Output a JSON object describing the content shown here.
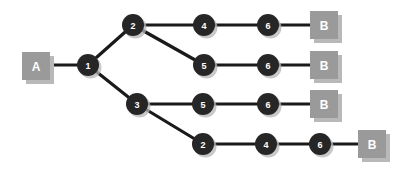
{
  "diagram": {
    "background_color": "#ffffff",
    "node_color": "#262626",
    "node_text_color": "#ffffff",
    "terminal_box_color": "#9a9a9a",
    "terminal_box_shadow_color": "#b9b9b9",
    "terminal_box_text_color": "#ffffff",
    "edge_color": "#1a1a1a",
    "source_label": "A",
    "destination_label": "B",
    "boxes": [
      {
        "id": "box-source-a",
        "label": "A",
        "x": 22,
        "y": 52,
        "w": 28,
        "h": 28
      },
      {
        "id": "box-dest-b-1",
        "label": "B",
        "x": 310,
        "y": 11,
        "w": 28,
        "h": 28
      },
      {
        "id": "box-dest-b-2",
        "label": "B",
        "x": 310,
        "y": 51,
        "w": 28,
        "h": 28
      },
      {
        "id": "box-dest-b-3",
        "label": "B",
        "x": 310,
        "y": 90,
        "w": 28,
        "h": 28
      },
      {
        "id": "box-dest-b-4",
        "label": "B",
        "x": 358,
        "y": 130,
        "w": 28,
        "h": 28
      }
    ],
    "nodes": [
      {
        "id": "node-1",
        "label": "1",
        "cx": 88,
        "cy": 65,
        "r": 11
      },
      {
        "id": "node-2-a",
        "label": "2",
        "cx": 133,
        "cy": 25,
        "r": 11
      },
      {
        "id": "node-3",
        "label": "3",
        "cx": 137,
        "cy": 104,
        "r": 11
      },
      {
        "id": "node-4-a",
        "label": "4",
        "cx": 204,
        "cy": 25,
        "r": 11
      },
      {
        "id": "node-6-a",
        "label": "6",
        "cx": 268,
        "cy": 25,
        "r": 11
      },
      {
        "id": "node-5-b",
        "label": "5",
        "cx": 204,
        "cy": 65,
        "r": 11
      },
      {
        "id": "node-6-b",
        "label": "6",
        "cx": 268,
        "cy": 65,
        "r": 11
      },
      {
        "id": "node-5-c",
        "label": "5",
        "cx": 203,
        "cy": 104,
        "r": 11
      },
      {
        "id": "node-6-c",
        "label": "6",
        "cx": 268,
        "cy": 104,
        "r": 11
      },
      {
        "id": "node-2-d",
        "label": "2",
        "cx": 203,
        "cy": 144,
        "r": 11
      },
      {
        "id": "node-4-d",
        "label": "4",
        "cx": 266,
        "cy": 144,
        "r": 11
      },
      {
        "id": "node-6-d",
        "label": "6",
        "cx": 320,
        "cy": 144,
        "r": 11
      }
    ],
    "edges": [
      {
        "id": "edge-a-to-1",
        "x1": 50,
        "y1": 65,
        "x2": 88,
        "y2": 65
      },
      {
        "id": "edge-1-to-2a",
        "x1": 88,
        "y1": 65,
        "x2": 133,
        "y2": 25
      },
      {
        "id": "edge-1-to-3",
        "x1": 88,
        "y1": 65,
        "x2": 137,
        "y2": 104
      },
      {
        "id": "edge-2a-to-4a",
        "x1": 133,
        "y1": 25,
        "x2": 204,
        "y2": 25
      },
      {
        "id": "edge-4a-to-6a",
        "x1": 204,
        "y1": 25,
        "x2": 268,
        "y2": 25
      },
      {
        "id": "edge-6a-to-b1",
        "x1": 268,
        "y1": 25,
        "x2": 312,
        "y2": 25
      },
      {
        "id": "edge-2a-to-5b",
        "x1": 133,
        "y1": 25,
        "x2": 204,
        "y2": 65
      },
      {
        "id": "edge-5b-to-6b",
        "x1": 204,
        "y1": 65,
        "x2": 268,
        "y2": 65
      },
      {
        "id": "edge-6b-to-b2",
        "x1": 268,
        "y1": 65,
        "x2": 312,
        "y2": 65
      },
      {
        "id": "edge-3-to-5c",
        "x1": 137,
        "y1": 104,
        "x2": 203,
        "y2": 104
      },
      {
        "id": "edge-5c-to-6c",
        "x1": 203,
        "y1": 104,
        "x2": 268,
        "y2": 104
      },
      {
        "id": "edge-6c-to-b3",
        "x1": 268,
        "y1": 104,
        "x2": 312,
        "y2": 104
      },
      {
        "id": "edge-3-to-2d",
        "x1": 137,
        "y1": 104,
        "x2": 203,
        "y2": 144
      },
      {
        "id": "edge-2d-to-4d",
        "x1": 203,
        "y1": 144,
        "x2": 266,
        "y2": 144
      },
      {
        "id": "edge-4d-to-6d",
        "x1": 266,
        "y1": 144,
        "x2": 320,
        "y2": 144
      },
      {
        "id": "edge-6d-to-b4",
        "x1": 320,
        "y1": 144,
        "x2": 360,
        "y2": 144
      }
    ]
  }
}
